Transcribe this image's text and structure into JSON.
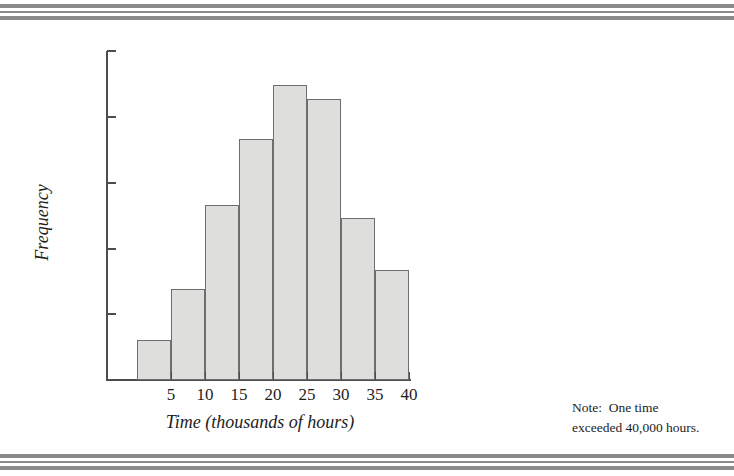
{
  "page": {
    "margin_fragments": [
      "·",
      "s",
      "s"
    ]
  },
  "chart_data": {
    "type": "bar",
    "title": "",
    "subtitle": "",
    "xlabel": "Time (thousands of hours)",
    "ylabel": "Frequency",
    "grid": false,
    "legend": "none",
    "xlim": [
      0,
      40
    ],
    "ylim": [
      0,
      325
    ],
    "bin_width": 5,
    "categories": [
      "0-5",
      "5-10",
      "10-15",
      "15-20",
      "20-25",
      "25-30",
      "30-35",
      "35-40"
    ],
    "x_tick_labels": [
      "5",
      "10",
      "15",
      "20",
      "25",
      "30",
      "35",
      "40"
    ],
    "x_tick_values": [
      5,
      10,
      15,
      20,
      25,
      30,
      35,
      40
    ],
    "y_tick_labels": [
      "325",
      "260",
      "195",
      "130",
      "65",
      "0"
    ],
    "y_tick_values": [
      325,
      260,
      195,
      130,
      65,
      0
    ],
    "values": [
      40,
      90,
      173,
      238,
      291,
      278,
      160,
      109
    ],
    "bar_fill": "#dededd",
    "bar_stroke": "#6e6e6e",
    "annotations": [
      "Note:  One time exceeded 40,000 hours."
    ]
  },
  "side_note": {
    "line1": "Note:  One time",
    "line2": "exceeded 40,000 hours."
  }
}
